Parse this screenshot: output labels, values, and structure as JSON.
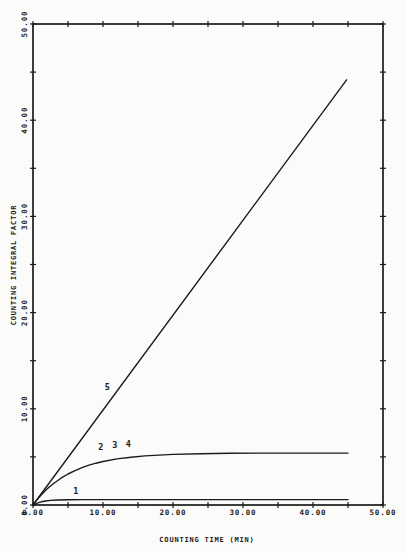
{
  "page": {
    "background_color": "#fbfbf9",
    "ink_color": "#1b1b1b"
  },
  "chart_data": {
    "type": "line",
    "title": "",
    "xlabel": "COUNTING TIME (MIN)",
    "ylabel": "COUNTING INTEGRAL FACTOR",
    "xlim": [
      0,
      50
    ],
    "ylim": [
      0,
      50
    ],
    "grid": false,
    "frame": true,
    "tick_style": "cross-ticks-all-four-sides",
    "minor_tick_step": 5,
    "x_major_ticks": [
      0,
      10,
      20,
      30,
      40,
      50
    ],
    "x_tick_labels": [
      "0.00",
      "10.00",
      "20.00",
      "30.00",
      "40.00",
      "50.00"
    ],
    "y_major_ticks": [
      0,
      10,
      20,
      30,
      40,
      50
    ],
    "y_tick_labels": [
      "0.00",
      "10.00",
      "20.00",
      "30.00",
      "40.00",
      "50.00"
    ],
    "legend_position": "none",
    "series": [
      {
        "name": "1",
        "points": [
          [
            0,
            0
          ],
          [
            0.4,
            0.12
          ],
          [
            0.8,
            0.24
          ],
          [
            1.2,
            0.33
          ],
          [
            1.8,
            0.42
          ],
          [
            2.5,
            0.48
          ],
          [
            3.5,
            0.52
          ],
          [
            5,
            0.55
          ],
          [
            7,
            0.56
          ],
          [
            10,
            0.56
          ],
          [
            15,
            0.56
          ],
          [
            20,
            0.56
          ],
          [
            25,
            0.56
          ],
          [
            30,
            0.56
          ],
          [
            35,
            0.56
          ],
          [
            40,
            0.56
          ],
          [
            45,
            0.56
          ]
        ]
      },
      {
        "name": "2,3,4",
        "points": [
          [
            0,
            0
          ],
          [
            0.5,
            0.48
          ],
          [
            1,
            0.9
          ],
          [
            1.5,
            1.3
          ],
          [
            2,
            1.65
          ],
          [
            2.5,
            1.97
          ],
          [
            3,
            2.27
          ],
          [
            4,
            2.79
          ],
          [
            5,
            3.22
          ],
          [
            6,
            3.58
          ],
          [
            7,
            3.88
          ],
          [
            8,
            4.14
          ],
          [
            9,
            4.35
          ],
          [
            10,
            4.52
          ],
          [
            12,
            4.79
          ],
          [
            14,
            4.97
          ],
          [
            16,
            5.1
          ],
          [
            18,
            5.19
          ],
          [
            20,
            5.26
          ],
          [
            24,
            5.33
          ],
          [
            28,
            5.37
          ],
          [
            32,
            5.39
          ],
          [
            36,
            5.4
          ],
          [
            40,
            5.4
          ],
          [
            45,
            5.4
          ]
        ]
      },
      {
        "name": "5",
        "points": [
          [
            0,
            0
          ],
          [
            44.8,
            44.2
          ]
        ]
      }
    ],
    "annotations": [
      {
        "text": "1",
        "x": 6.1,
        "y": 1.5
      },
      {
        "text": "2",
        "x": 9.7,
        "y": 6.0
      },
      {
        "text": "3",
        "x": 11.7,
        "y": 6.2
      },
      {
        "text": "4",
        "x": 13.6,
        "y": 6.3
      },
      {
        "text": "5",
        "x": 10.6,
        "y": 12.3
      }
    ]
  }
}
